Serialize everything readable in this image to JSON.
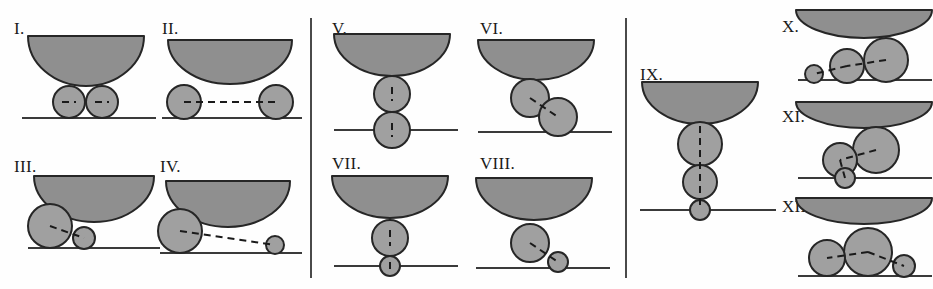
{
  "figure": {
    "width": 933,
    "height": 289,
    "background": "#fefefe"
  },
  "style": {
    "bowl_fill": "#8f8f8f",
    "bowl_stroke": "#262626",
    "circle_fill": "#a0a0a0",
    "circle_stroke": "#262626",
    "ground_stroke": "#3a3a3a",
    "dash_stroke": "#1a1a1a",
    "divider_stroke": "#4a4a4a",
    "label_color": "#1a1a1a"
  },
  "dividers": [
    {
      "name": "divider-1",
      "x": 310,
      "y": 18,
      "height": 260
    },
    {
      "name": "divider-2",
      "x": 625,
      "y": 18,
      "height": 260
    }
  ],
  "panels": [
    {
      "name": "panel-group-1",
      "x": 0,
      "y": 0,
      "width": 310,
      "height": 289
    },
    {
      "name": "panel-group-2",
      "x": 310,
      "y": 0,
      "width": 315,
      "height": 289
    },
    {
      "name": "panel-group-3",
      "x": 625,
      "y": 0,
      "width": 308,
      "height": 289
    }
  ],
  "chart_data": {
    "type": "diagram",
    "xlabel": "",
    "ylabel": "",
    "legend": [],
    "annotations": [],
    "configurations": [
      {
        "label": "I.",
        "label_x": 14,
        "label_y": 20,
        "art_x": 16,
        "art_y": 30,
        "art_w": 140,
        "art_h": 100,
        "bowl": {
          "cx": 70,
          "cy": 6,
          "rx": 58,
          "ry": 50
        },
        "ground_y": 88,
        "ground_x1": 6,
        "ground_x2": 140,
        "circles": [
          {
            "cx": 53,
            "cy": 72,
            "r": 16
          },
          {
            "cx": 86,
            "cy": 72,
            "r": 16
          }
        ],
        "dashes": [
          {
            "x1": 46,
            "y1": 72,
            "x2": 60,
            "y2": 72
          },
          {
            "x1": 79,
            "y1": 72,
            "x2": 93,
            "y2": 72
          }
        ]
      },
      {
        "label": "II.",
        "label_x": 162,
        "label_y": 20,
        "art_x": 158,
        "art_y": 34,
        "art_w": 145,
        "art_h": 100,
        "bowl": {
          "cx": 72,
          "cy": 6,
          "rx": 62,
          "ry": 44
        },
        "ground_y": 84,
        "ground_x1": 4,
        "ground_x2": 144,
        "circles": [
          {
            "cx": 26,
            "cy": 68,
            "r": 17
          },
          {
            "cx": 118,
            "cy": 68,
            "r": 17
          }
        ],
        "dashes": [
          {
            "x1": 26,
            "y1": 68,
            "x2": 118,
            "y2": 68
          }
        ]
      },
      {
        "label": "III.",
        "label_x": 14,
        "label_y": 158,
        "art_x": 20,
        "art_y": 170,
        "art_w": 140,
        "art_h": 100,
        "bowl": {
          "cx": 74,
          "cy": 6,
          "rx": 60,
          "ry": 46
        },
        "ground_y": 78,
        "ground_x1": 8,
        "ground_x2": 140,
        "circles": [
          {
            "cx": 30,
            "cy": 56,
            "r": 22
          },
          {
            "cx": 64,
            "cy": 68,
            "r": 11
          }
        ],
        "dashes": [
          {
            "x1": 30,
            "y1": 56,
            "x2": 64,
            "y2": 68
          }
        ]
      },
      {
        "label": "IV.",
        "label_x": 160,
        "label_y": 158,
        "art_x": 158,
        "art_y": 175,
        "art_w": 145,
        "art_h": 100,
        "bowl": {
          "cx": 70,
          "cy": 6,
          "rx": 62,
          "ry": 46
        },
        "ground_y": 78,
        "ground_x1": 2,
        "ground_x2": 144,
        "circles": [
          {
            "cx": 22,
            "cy": 56,
            "r": 22
          },
          {
            "cx": 117,
            "cy": 70,
            "r": 9
          }
        ],
        "dashes": [
          {
            "x1": 22,
            "y1": 56,
            "x2": 117,
            "y2": 70
          }
        ]
      },
      {
        "label": "V.",
        "label_x": 332,
        "label_y": 20,
        "art_x": 330,
        "art_y": 30,
        "art_w": 135,
        "art_h": 110,
        "bowl": {
          "cx": 62,
          "cy": 4,
          "rx": 58,
          "ry": 42
        },
        "ground_y": 100,
        "ground_x1": 4,
        "ground_x2": 128,
        "circles": [
          {
            "cx": 62,
            "cy": 64,
            "r": 18
          },
          {
            "cx": 62,
            "cy": 100,
            "r": 18
          }
        ],
        "dashes": [
          {
            "x1": 62,
            "y1": 57,
            "x2": 62,
            "y2": 71
          },
          {
            "x1": 62,
            "y1": 93,
            "x2": 62,
            "y2": 107
          }
        ]
      },
      {
        "label": "VI.",
        "label_x": 480,
        "label_y": 20,
        "art_x": 478,
        "art_y": 36,
        "art_w": 140,
        "art_h": 110,
        "bowl": {
          "cx": 58,
          "cy": 4,
          "rx": 58,
          "ry": 40
        },
        "ground_y": 96,
        "ground_x1": 0,
        "ground_x2": 134,
        "circles": [
          {
            "cx": 52,
            "cy": 62,
            "r": 19
          },
          {
            "cx": 80,
            "cy": 81,
            "r": 19
          }
        ],
        "dashes": [
          {
            "x1": 52,
            "y1": 62,
            "x2": 80,
            "y2": 81
          }
        ]
      },
      {
        "label": "VII.",
        "label_x": 332,
        "label_y": 155,
        "art_x": 330,
        "art_y": 172,
        "art_w": 135,
        "art_h": 100,
        "bowl": {
          "cx": 60,
          "cy": 4,
          "rx": 58,
          "ry": 42
        },
        "ground_y": 94,
        "ground_x1": 4,
        "ground_x2": 128,
        "circles": [
          {
            "cx": 60,
            "cy": 66,
            "r": 18
          },
          {
            "cx": 60,
            "cy": 94,
            "r": 10
          }
        ],
        "dashes": [
          {
            "x1": 60,
            "y1": 58,
            "x2": 60,
            "y2": 74
          },
          {
            "x1": 60,
            "y1": 90,
            "x2": 60,
            "y2": 98
          }
        ]
      },
      {
        "label": "VIII.",
        "label_x": 480,
        "label_y": 155,
        "art_x": 476,
        "art_y": 174,
        "art_w": 142,
        "art_h": 100,
        "bowl": {
          "cx": 58,
          "cy": 4,
          "rx": 58,
          "ry": 42
        },
        "ground_y": 94,
        "ground_x1": 0,
        "ground_x2": 134,
        "circles": [
          {
            "cx": 54,
            "cy": 69,
            "r": 19
          },
          {
            "cx": 82,
            "cy": 88,
            "r": 10
          }
        ],
        "dashes": [
          {
            "x1": 54,
            "y1": 69,
            "x2": 82,
            "y2": 88
          }
        ]
      },
      {
        "label": "IX.",
        "label_x": 640,
        "label_y": 66,
        "art_x": 638,
        "art_y": 78,
        "art_w": 145,
        "art_h": 160,
        "bowl": {
          "cx": 62,
          "cy": 4,
          "rx": 58,
          "ry": 42
        },
        "ground_y": 132,
        "ground_x1": 2,
        "ground_x2": 138,
        "circles": [
          {
            "cx": 62,
            "cy": 66,
            "r": 22
          },
          {
            "cx": 62,
            "cy": 104,
            "r": 17
          },
          {
            "cx": 62,
            "cy": 132,
            "r": 10
          }
        ],
        "dashes": [
          {
            "x1": 62,
            "y1": 48,
            "x2": 62,
            "y2": 132
          }
        ]
      },
      {
        "label": "X.",
        "label_x": 782,
        "label_y": 18,
        "art_x": 790,
        "art_y": 8,
        "art_w": 142,
        "art_h": 85,
        "bowl": {
          "cx": 74,
          "cy": 2,
          "rx": 68,
          "ry": 28
        },
        "ground_y": 72,
        "ground_x1": 8,
        "ground_x2": 142,
        "circles": [
          {
            "cx": 96,
            "cy": 52,
            "r": 22
          },
          {
            "cx": 57,
            "cy": 58,
            "r": 17
          },
          {
            "cx": 24,
            "cy": 66,
            "r": 9
          }
        ],
        "dashes": [
          {
            "x1": 96,
            "y1": 52,
            "x2": 57,
            "y2": 58
          },
          {
            "x1": 57,
            "y1": 58,
            "x2": 24,
            "y2": 66
          }
        ]
      },
      {
        "label": "XI.",
        "label_x": 782,
        "label_y": 108,
        "art_x": 790,
        "art_y": 100,
        "art_w": 142,
        "art_h": 88,
        "bowl": {
          "cx": 74,
          "cy": 2,
          "rx": 68,
          "ry": 26
        },
        "ground_y": 78,
        "ground_x1": 8,
        "ground_x2": 142,
        "circles": [
          {
            "cx": 86,
            "cy": 50,
            "r": 23
          },
          {
            "cx": 50,
            "cy": 60,
            "r": 17
          },
          {
            "cx": 55,
            "cy": 78,
            "r": 10
          }
        ],
        "dashes": [
          {
            "x1": 86,
            "y1": 50,
            "x2": 50,
            "y2": 60
          },
          {
            "x1": 50,
            "y1": 60,
            "x2": 55,
            "y2": 78
          }
        ]
      },
      {
        "label": "XII.",
        "label_x": 782,
        "label_y": 198,
        "art_x": 790,
        "art_y": 196,
        "art_w": 142,
        "art_h": 88,
        "bowl": {
          "cx": 74,
          "cy": 2,
          "rx": 68,
          "ry": 26
        },
        "ground_y": 80,
        "ground_x1": 8,
        "ground_x2": 142,
        "circles": [
          {
            "cx": 78,
            "cy": 56,
            "r": 24
          },
          {
            "cx": 37,
            "cy": 62,
            "r": 18
          },
          {
            "cx": 114,
            "cy": 70,
            "r": 11
          }
        ],
        "dashes": [
          {
            "x1": 78,
            "y1": 56,
            "x2": 37,
            "y2": 62
          },
          {
            "x1": 78,
            "y1": 56,
            "x2": 114,
            "y2": 70
          }
        ]
      }
    ]
  }
}
